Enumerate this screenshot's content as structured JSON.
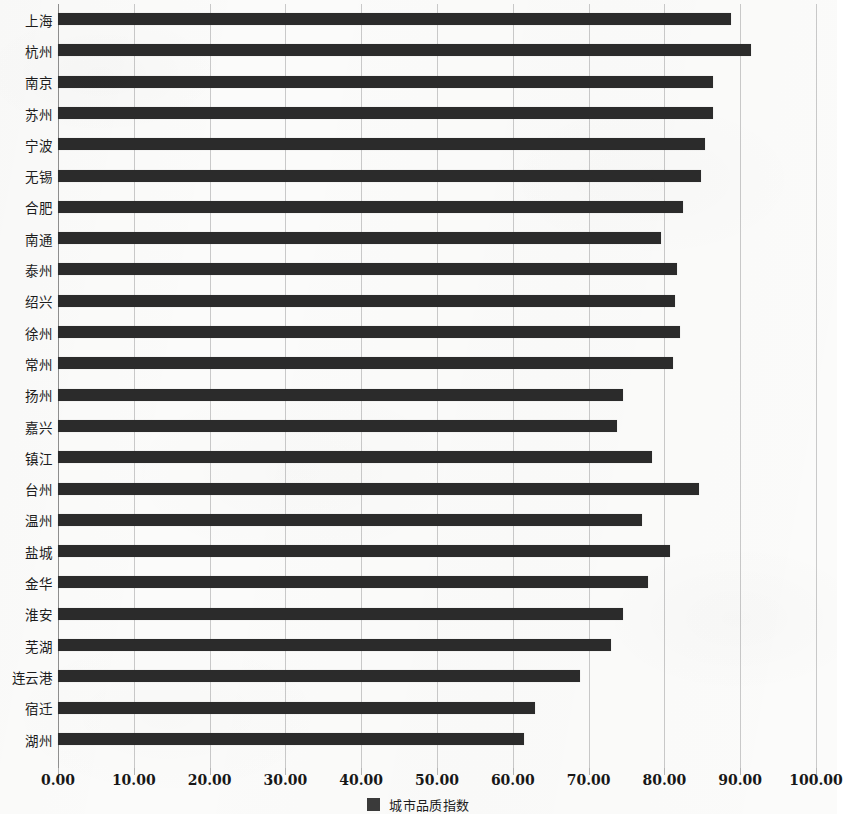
{
  "chart_data": {
    "type": "bar",
    "orientation": "horizontal",
    "title": "",
    "subtitle": "",
    "xlabel": "",
    "ylabel": "",
    "xlim": [
      0,
      100
    ],
    "xtick_step": 10,
    "grid": true,
    "legend_position": "bottom-center",
    "series_name": "城市品质指数",
    "bar_color": "#2b2b2b",
    "categories": [
      "上海",
      "杭州",
      "南京",
      "苏州",
      "宁波",
      "无锡",
      "合肥",
      "南通",
      "泰州",
      "绍兴",
      "徐州",
      "常州",
      "扬州",
      "嘉兴",
      "镇江",
      "台州",
      "温州",
      "盐城",
      "金华",
      "淮安",
      "芜湖",
      "连云港",
      "宿迁",
      "湖州"
    ],
    "values": [
      88.8,
      91.4,
      86.4,
      86.4,
      85.4,
      84.8,
      82.4,
      79.6,
      81.7,
      81.4,
      82.1,
      81.2,
      74.5,
      73.8,
      78.3,
      84.6,
      77.0,
      80.7,
      77.9,
      74.5,
      72.9,
      68.8,
      62.9,
      61.5
    ],
    "xtick_labels": [
      "0.00",
      "10.00",
      "20.00",
      "30.00",
      "40.00",
      "50.00",
      "60.00",
      "70.00",
      "80.00",
      "90.00",
      "100.00"
    ],
    "xtick_values": [
      0,
      10,
      20,
      30,
      40,
      50,
      60,
      70,
      80,
      90,
      100
    ],
    "legend": [
      {
        "label": "城市品质指数",
        "color": "#3a3a3a"
      }
    ]
  }
}
